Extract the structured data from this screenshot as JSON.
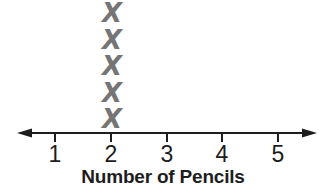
{
  "chart_data": {
    "type": "line_plot",
    "title": "",
    "xlabel": "Number of Pencils",
    "ylabel": "",
    "categories": [
      "1",
      "2",
      "3",
      "4",
      "5"
    ],
    "values": [
      0,
      5,
      0,
      0,
      0
    ],
    "axis_range": [
      1,
      5
    ],
    "marker": "X",
    "marker_color": "#757575",
    "axis_color": "#1d1d1d",
    "x_axis_arrows": "both-ends",
    "grid": "off",
    "legend": "none"
  }
}
